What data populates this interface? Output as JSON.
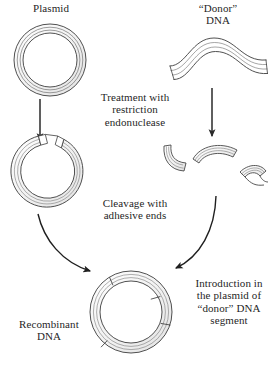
{
  "figure": {
    "type": "biology-process-diagram",
    "background_color": "#ffffff",
    "line_color": "#3a3a3a",
    "ribbon_fill": "#f2f2f2",
    "text_color": "#1f1f1f"
  },
  "labels": {
    "plasmid": "Plasmid",
    "donor_dna": "“Donor”\nDNA",
    "treatment": "Treatment with\nrestriction\nendonuclease",
    "cleavage": "Cleavage with\nadhesive ends",
    "introduction": "Introduction in\nthe plasmid of\n“donor” DNA\nsegment",
    "recombinant": "Recombinant\nDNA"
  },
  "shapes": {
    "plasmid_circle": {
      "name": "intact-plasmid",
      "cx": 50,
      "cy": 60,
      "outer_r": 36,
      "inner_r": 27
    },
    "donor_strand": {
      "name": "donor-dna-wave",
      "x_start": 168,
      "x_end": 268,
      "y_center": 55
    },
    "cut_plasmid": {
      "name": "cut-plasmid-open-ring",
      "cx": 46,
      "cy": 172,
      "outer_r": 36,
      "inner_r": 27,
      "gap_top_degrees": 40
    },
    "fragments": [
      {
        "name": "dna-fragment-left",
        "cx": 176,
        "cy": 163
      },
      {
        "name": "dna-fragment-middle",
        "cx": 215,
        "cy": 158
      },
      {
        "name": "dna-fragment-right",
        "cx": 252,
        "cy": 180
      }
    ],
    "recombinant_circle": {
      "name": "recombinant-plasmid",
      "cx": 131,
      "cy": 312,
      "outer_r": 41,
      "inner_r": 31,
      "junction_count": 4
    }
  },
  "arrows": [
    {
      "name": "arrow-plasmid-down",
      "kind": "straight",
      "x1": 40,
      "y1": 99,
      "x2": 40,
      "y2": 140
    },
    {
      "name": "arrow-donor-down",
      "kind": "straight",
      "x1": 212,
      "y1": 88,
      "x2": 212,
      "y2": 136
    },
    {
      "name": "arrow-cut-plasmid-to-recombinant",
      "kind": "curved",
      "x1": 38,
      "y1": 214,
      "x2": 92,
      "y2": 272
    },
    {
      "name": "arrow-fragments-to-recombinant",
      "kind": "curved",
      "x1": 216,
      "y1": 196,
      "x2": 174,
      "y2": 269
    }
  ]
}
